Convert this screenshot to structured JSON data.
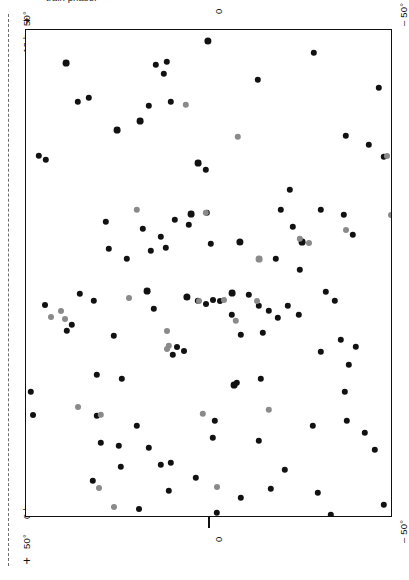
{
  "figure": {
    "caption_partial": "train phase.",
    "background_color": "#ffffff",
    "frame_color": "#111111",
    "guide_line_color": "#6f6f6f"
  },
  "axes": {
    "left_labels": [
      {
        "text": "12 h",
        "kind": "right-ascension"
      },
      {
        "text": "0 h",
        "kind": "right-ascension"
      }
    ],
    "corner_labels": [
      {
        "text": "+ 50°",
        "position": "top-left"
      },
      {
        "text": "− 50°",
        "position": "top-right"
      },
      {
        "text": "+ 50°",
        "position": "bottom-left"
      },
      {
        "text": "− 50°",
        "position": "bottom-right"
      }
    ],
    "top_tick_label": "0",
    "bottom_tick_label": "0",
    "plus_marks": [
      "+",
      "+"
    ]
  },
  "chart_data": {
    "type": "scatter",
    "title": "",
    "xlabel": "",
    "ylabel": "",
    "xlim": [
      -50,
      50
    ],
    "ylim": [
      0,
      12
    ],
    "grid": false,
    "legend": "none",
    "axis_note": "Equatorial all-sky scatter; horizontal axis declination -50 to +50 deg, vertical axis right ascension 0 h to 12 h. Labels rotated 90 degrees.",
    "series": [
      {
        "name": "dark sources",
        "color": "#111111",
        "points": [
          [
            65,
            62,
            3.4
          ],
          [
            77,
            101,
            3.2
          ],
          [
            88,
            97,
            3.2
          ],
          [
            139,
            120,
            3.4
          ],
          [
            148,
            105,
            3.2
          ],
          [
            155,
            64,
            3.2
          ],
          [
            163,
            73,
            3.2
          ],
          [
            166,
            61,
            3.2
          ],
          [
            170,
            101,
            3.2
          ],
          [
            207,
            40,
            3.6
          ],
          [
            257,
            79,
            3.2
          ],
          [
            313,
            52,
            3.2
          ],
          [
            378,
            87,
            3.2
          ],
          [
            38,
            155,
            3.2
          ],
          [
            45,
            159,
            3.2
          ],
          [
            116,
            129,
            3.4
          ],
          [
            197,
            162,
            3.4
          ],
          [
            205,
            169,
            3.2
          ],
          [
            345,
            135,
            3.2
          ],
          [
            368,
            144,
            3.2
          ],
          [
            383,
            156,
            3.2
          ],
          [
            105,
            221,
            3.2
          ],
          [
            142,
            228,
            3.2
          ],
          [
            160,
            236,
            3.2
          ],
          [
            174,
            219,
            3.2
          ],
          [
            190,
            213,
            3.4
          ],
          [
            206,
            212,
            3.2
          ],
          [
            280,
            209,
            3.2
          ],
          [
            292,
            226,
            3.2
          ],
          [
            320,
            209,
            3.2
          ],
          [
            343,
            214,
            3.2
          ],
          [
            352,
            234,
            3.2
          ],
          [
            289,
            189,
            3.2
          ],
          [
            150,
            250,
            3.2
          ],
          [
            165,
            247,
            3.2
          ],
          [
            108,
            248,
            3.2
          ],
          [
            126,
            258,
            3.2
          ],
          [
            210,
            243,
            3.2
          ],
          [
            239,
            241,
            3.6
          ],
          [
            275,
            258,
            3.2
          ],
          [
            299,
            269,
            3.2
          ],
          [
            79,
            293,
            3.2
          ],
          [
            93,
            300,
            3.2
          ],
          [
            146,
            290,
            3.4
          ],
          [
            153,
            308,
            3.2
          ],
          [
            186,
            296,
            3.6
          ],
          [
            197,
            300,
            3.2
          ],
          [
            205,
            303,
            3.0
          ],
          [
            212,
            299,
            3.0
          ],
          [
            219,
            300,
            3.0
          ],
          [
            231,
            292,
            3.4
          ],
          [
            248,
            294,
            3.2
          ],
          [
            258,
            305,
            3.2
          ],
          [
            268,
            310,
            3.2
          ],
          [
            277,
            317,
            3.2
          ],
          [
            287,
            305,
            3.2
          ],
          [
            298,
            314,
            3.2
          ],
          [
            325,
            291,
            3.2
          ],
          [
            334,
            300,
            3.2
          ],
          [
            66,
            330,
            3.2
          ],
          [
            71,
            324,
            3.2
          ],
          [
            113,
            335,
            3.2
          ],
          [
            172,
            354,
            3.2
          ],
          [
            176,
            346,
            3.0
          ],
          [
            183,
            350,
            3.0
          ],
          [
            240,
            334,
            3.2
          ],
          [
            262,
            332,
            3.2
          ],
          [
            320,
            351,
            3.2
          ],
          [
            340,
            339,
            3.2
          ],
          [
            348,
            364,
            3.2
          ],
          [
            355,
            346,
            3.2
          ],
          [
            96,
            374,
            3.2
          ],
          [
            121,
            378,
            3.2
          ],
          [
            236,
            382,
            3.2
          ],
          [
            260,
            378,
            3.2
          ],
          [
            30,
            391,
            3.2
          ],
          [
            32,
            414,
            3.0
          ],
          [
            136,
            425,
            3.2
          ],
          [
            233,
            384,
            3.4
          ],
          [
            118,
            445,
            3.2
          ],
          [
            100,
            442,
            3.2
          ],
          [
            148,
            447,
            3.2
          ],
          [
            160,
            464,
            3.2
          ],
          [
            170,
            462,
            3.2
          ],
          [
            212,
            437,
            3.2
          ],
          [
            214,
            420,
            3.2
          ],
          [
            258,
            440,
            3.2
          ],
          [
            312,
            425,
            3.2
          ],
          [
            346,
            420,
            3.2
          ],
          [
            344,
            391,
            3.2
          ],
          [
            364,
            432,
            3.2
          ],
          [
            374,
            449,
            3.2
          ],
          [
            383,
            504,
            3.2
          ],
          [
            120,
            466,
            3.2
          ],
          [
            92,
            480,
            3.2
          ],
          [
            168,
            490,
            3.2
          ],
          [
            216,
            512,
            3.2
          ],
          [
            240,
            497,
            3.2
          ],
          [
            270,
            488,
            3.2
          ],
          [
            317,
            492,
            3.2
          ],
          [
            330,
            514,
            3.2
          ],
          [
            138,
            508,
            3.0
          ],
          [
            195,
            477,
            3.2
          ],
          [
            284,
            469,
            3.2
          ],
          [
            96,
            415,
            3.2
          ],
          [
            188,
            224,
            3.2
          ],
          [
            301,
            241,
            3.4
          ],
          [
            231,
            314,
            3.2
          ],
          [
            44,
            304,
            3.0
          ]
        ]
      },
      {
        "name": "grey sources",
        "color": "#8a8a8a",
        "points": [
          [
            185,
            104,
            3.2
          ],
          [
            237,
            136,
            3.2
          ],
          [
            136,
            209,
            3.2
          ],
          [
            205,
            212,
            3.2
          ],
          [
            299,
            238,
            3.2
          ],
          [
            345,
            229,
            3.0
          ],
          [
            258,
            258,
            3.4
          ],
          [
            128,
            297,
            3.0
          ],
          [
            235,
            320,
            3.2
          ],
          [
            256,
            300,
            3.0
          ],
          [
            168,
            345,
            3.2
          ],
          [
            223,
            299,
            3.0
          ],
          [
            77,
            406,
            3.0
          ],
          [
            100,
            414,
            3.2
          ],
          [
            202,
            413,
            3.2
          ],
          [
            268,
            409,
            3.2
          ],
          [
            166,
            348,
            3.0
          ],
          [
            64,
            318,
            3.0
          ],
          [
            50,
            316,
            3.0
          ],
          [
            98,
            487,
            3.0
          ],
          [
            122,
            530,
            3.0
          ],
          [
            355,
            518,
            3.0
          ],
          [
            216,
            486,
            3.0
          ],
          [
            198,
            300,
            3.0
          ],
          [
            386,
            155,
            3.0
          ],
          [
            390,
            214,
            3.0
          ],
          [
            60,
            310,
            3.0
          ],
          [
            113,
            506,
            3.0
          ],
          [
            166,
            330,
            3.0
          ],
          [
            308,
            242,
            3.0
          ]
        ]
      }
    ]
  }
}
